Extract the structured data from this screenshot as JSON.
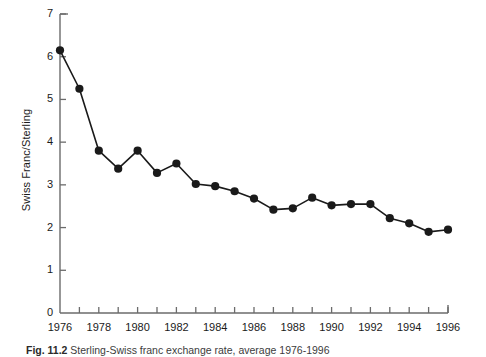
{
  "chart_data": {
    "type": "line",
    "title": "",
    "xlabel": "",
    "ylabel": "Swiss Franc/Sterling",
    "xlim": [
      1976,
      1996
    ],
    "ylim": [
      0,
      7
    ],
    "grid": false,
    "legend": null,
    "marker": "filled-circle",
    "line_color": "#1a1a1a",
    "marker_color": "#1a1a1a",
    "x": [
      1976,
      1977,
      1978,
      1979,
      1980,
      1981,
      1982,
      1983,
      1984,
      1985,
      1986,
      1987,
      1988,
      1989,
      1990,
      1991,
      1992,
      1993,
      1994,
      1995,
      1996
    ],
    "values": [
      6.15,
      5.25,
      3.8,
      3.38,
      3.8,
      3.28,
      3.5,
      3.02,
      2.97,
      2.85,
      2.68,
      2.42,
      2.45,
      2.7,
      2.52,
      2.55,
      2.55,
      2.22,
      2.1,
      1.9,
      1.95
    ],
    "ytick_values": [
      0,
      1,
      2,
      3,
      4,
      5,
      6,
      7
    ],
    "ytick_labels": [
      "0",
      "1",
      "2",
      "3",
      "4",
      "5",
      "6",
      "7"
    ],
    "xtick_values": [
      1976,
      1978,
      1980,
      1982,
      1984,
      1986,
      1988,
      1990,
      1992,
      1994,
      1996
    ],
    "xtick_labels": [
      "1976",
      "1978",
      "1980",
      "1982",
      "1984",
      "1986",
      "1988",
      "1990",
      "1992",
      "1994",
      "1996"
    ],
    "xminor_values": [
      1977,
      1979,
      1981,
      1983,
      1985,
      1987,
      1989,
      1991,
      1993,
      1995
    ]
  },
  "caption": {
    "figure_number": "Fig. 11.2",
    "text": "Sterling-Swiss franc exchange rate, average 1976-1996"
  }
}
